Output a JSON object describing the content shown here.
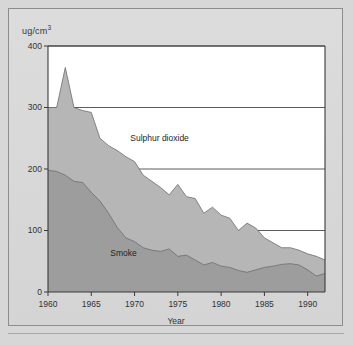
{
  "chart_data": {
    "type": "area",
    "title": "",
    "subtitle": "",
    "xlabel": "Year",
    "ylabel": "ug/cm³",
    "ylabel_plain": "ug/cm3",
    "xlim": [
      1960,
      1992
    ],
    "ylim": [
      0,
      400
    ],
    "ytick_values": [
      0,
      100,
      200,
      300,
      400
    ],
    "ytick_labels": [
      "0",
      "100",
      "200",
      "300",
      "400"
    ],
    "xtick_values": [
      1960,
      1965,
      1970,
      1975,
      1980,
      1985,
      1990
    ],
    "xtick_labels": [
      "1960",
      "1965",
      "1970",
      "1975",
      "1980",
      "1985",
      "1990"
    ],
    "grid": "horizontal",
    "stacked": false,
    "legend": "inline-annotations",
    "annotations": [
      {
        "text": "Sulphur dioxide",
        "x": 1969.5,
        "y": 248
      },
      {
        "text": "Smoke",
        "x": 1967.2,
        "y": 62
      }
    ],
    "x": [
      1960,
      1961,
      1962,
      1963,
      1964,
      1965,
      1966,
      1967,
      1968,
      1969,
      1970,
      1971,
      1972,
      1973,
      1974,
      1975,
      1976,
      1977,
      1978,
      1979,
      1980,
      1981,
      1982,
      1983,
      1984,
      1985,
      1986,
      1987,
      1988,
      1989,
      1990,
      1991,
      1992
    ],
    "series": [
      {
        "name": "Sulphur dioxide",
        "color": "#b6b6b6",
        "values": [
          300,
          300,
          365,
          300,
          295,
          292,
          250,
          238,
          230,
          220,
          212,
          190,
          180,
          170,
          158,
          175,
          155,
          152,
          128,
          138,
          125,
          120,
          100,
          112,
          104,
          88,
          80,
          72,
          72,
          68,
          62,
          58,
          52
        ]
      },
      {
        "name": "Smoke",
        "color": "#9d9d9d",
        "values": [
          198,
          196,
          190,
          180,
          178,
          162,
          148,
          128,
          105,
          88,
          82,
          72,
          68,
          66,
          70,
          58,
          60,
          52,
          44,
          48,
          42,
          40,
          35,
          32,
          36,
          40,
          42,
          45,
          46,
          44,
          36,
          26,
          30
        ]
      }
    ]
  },
  "figure": {
    "background_color": "#d7d7d7",
    "plot_background_color": "#ffffff",
    "frame_color": "#8d8d8d",
    "axis_color": "#3a3a3a",
    "grid_color": "#4a4a4a"
  }
}
